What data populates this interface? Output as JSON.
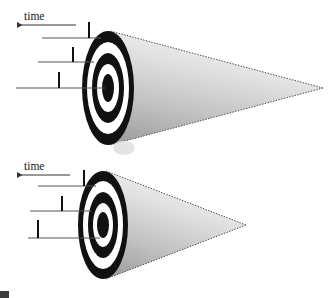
{
  "figure": {
    "width": 331,
    "height": 298,
    "background_color": "#ffffff"
  },
  "panels": [
    {
      "id": "upper-panel",
      "time_axis": {
        "label": "time",
        "label_x": 24,
        "label_y": 16,
        "arrow": {
          "direction": "left",
          "x_start": 76,
          "x_end": 16,
          "y": 25
        }
      },
      "tick_rows": [
        {
          "line_x_start": 42,
          "line_x_end": 100,
          "line_y": 38,
          "tick_x": 89,
          "tick_y_top": 22,
          "tick_y_bottom": 38
        },
        {
          "line_x_start": 38,
          "line_x_end": 93,
          "line_y": 62,
          "tick_x": 73,
          "tick_y_top": 47,
          "tick_y_bottom": 62
        },
        {
          "line_x_start": 16,
          "line_x_end": 104,
          "line_y": 88,
          "tick_x": 59,
          "tick_y_top": 72,
          "tick_y_bottom": 88
        }
      ],
      "cone": {
        "apex_x": 323,
        "apex_y": 88,
        "base_center_x": 110,
        "base_center_y": 88,
        "base_rx": 13,
        "base_ry": 57,
        "fill_light": "#eeeeee",
        "fill_dark": "#a8a8a8",
        "edge_color": "#4d4d4d"
      },
      "target": {
        "center_x": 108,
        "center_y": 88,
        "rings": [
          {
            "rx": 26,
            "ry": 57,
            "color": "#111111"
          },
          {
            "rx": 21,
            "ry": 46,
            "color": "#ffffff"
          },
          {
            "rx": 16,
            "ry": 35,
            "color": "#111111"
          },
          {
            "rx": 11,
            "ry": 24,
            "color": "#ffffff"
          },
          {
            "rx": 6,
            "ry": 14,
            "color": "#111111"
          }
        ]
      }
    },
    {
      "id": "lower-panel",
      "time_axis": {
        "label": "time",
        "label_x": 24,
        "label_y": 166,
        "arrow": {
          "direction": "left",
          "x_start": 70,
          "x_end": 16,
          "y": 175
        }
      },
      "tick_rows": [
        {
          "line_x_start": 38,
          "line_x_end": 95,
          "line_y": 186,
          "tick_x": 84,
          "tick_y_top": 170,
          "tick_y_bottom": 186
        },
        {
          "line_x_start": 30,
          "line_x_end": 90,
          "line_y": 211,
          "tick_x": 62,
          "tick_y_top": 196,
          "tick_y_bottom": 211
        },
        {
          "line_x_start": 28,
          "line_x_end": 99,
          "line_y": 238,
          "tick_x": 38,
          "tick_y_top": 220,
          "tick_y_bottom": 238
        }
      ],
      "cone": {
        "apex_x": 246,
        "apex_y": 225,
        "base_center_x": 106,
        "base_center_y": 225,
        "base_rx": 12,
        "base_ry": 54,
        "fill_light": "#eeeeee",
        "fill_dark": "#a8a8a8",
        "edge_color": "#4d4d4d"
      },
      "target": {
        "center_x": 103,
        "center_y": 225,
        "rings": [
          {
            "rx": 25,
            "ry": 54,
            "color": "#111111"
          },
          {
            "rx": 20,
            "ry": 44,
            "color": "#ffffff"
          },
          {
            "rx": 15,
            "ry": 33,
            "color": "#111111"
          },
          {
            "rx": 10,
            "ry": 22,
            "color": "#ffffff"
          },
          {
            "rx": 6,
            "ry": 13,
            "color": "#111111"
          }
        ]
      }
    }
  ],
  "artifacts": [
    {
      "id": "corner-mark",
      "x": 0,
      "y": 291,
      "width": 9,
      "height": 7,
      "color": "#3d3d3d"
    },
    {
      "id": "smudge-between-panels",
      "x": 113,
      "y": 141,
      "width": 22,
      "height": 14,
      "color": "#d9d9d9"
    }
  ],
  "line_style": {
    "leader_color": "#555555",
    "leader_width": 1,
    "tick_color": "#111111",
    "tick_width": 2,
    "arrow_color": "#333333"
  }
}
